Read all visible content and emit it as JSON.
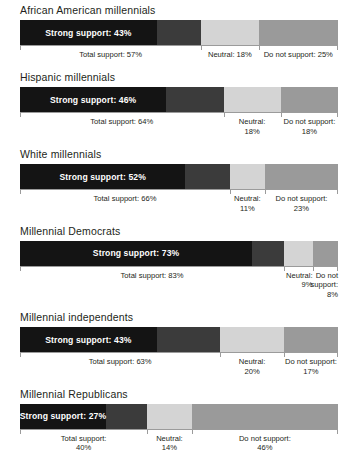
{
  "chart_data": {
    "type": "bar",
    "orientation": "horizontal",
    "stacked": true,
    "title": "",
    "xlabel": "",
    "ylabel": "",
    "xlim": [
      0,
      100
    ],
    "grid": false,
    "legend_position": "none",
    "series": [
      {
        "name": "Strong support",
        "values": [
          43,
          46,
          52,
          73,
          43,
          27
        ]
      },
      {
        "name": "Total support",
        "values": [
          57,
          64,
          66,
          83,
          63,
          40
        ]
      },
      {
        "name": "Neutral",
        "values": [
          18,
          18,
          11,
          9,
          20,
          14
        ]
      },
      {
        "name": "Do not support",
        "values": [
          25,
          18,
          23,
          8,
          17,
          46
        ]
      }
    ],
    "categories": [
      "African American millennials",
      "Hispanic millennials",
      "White millennials",
      "Millennial Democrats",
      "Millennial independents",
      "Millennial Republicans"
    ],
    "colors": {
      "strong_support": "#141414",
      "total_support": "#3b3b3b",
      "neutral": "#d4d4d4",
      "do_not_support": "#9a9a9a",
      "axis": "#9b9b9b",
      "text": "#231f20",
      "bar_label_text": "#ffffff",
      "background": "#ffffff"
    }
  },
  "groups": [
    {
      "title": "African American millennials",
      "strong_label": "Strong support: 43%",
      "strong_pct": 43,
      "total_pct": 57,
      "neutral_pct": 18,
      "oppose_pct": 25,
      "label_total": "Total support: 57%",
      "label_neutral": "Neutral: 18%",
      "label_oppose": "Do not support: 25%",
      "label_style": "single-line"
    },
    {
      "title": "Hispanic millennials",
      "strong_label": "Strong support: 46%",
      "strong_pct": 46,
      "total_pct": 64,
      "neutral_pct": 18,
      "oppose_pct": 18,
      "label_total": "Total support: 64%",
      "label_neutral": "Neutral:\n18%",
      "label_oppose": "Do not support:\n18%",
      "label_style": "two-line"
    },
    {
      "title": "White millennials",
      "strong_label": "Strong support: 52%",
      "strong_pct": 52,
      "total_pct": 66,
      "neutral_pct": 11,
      "oppose_pct": 23,
      "label_total": "Total support: 66%",
      "label_neutral": "Neutral:\n11%",
      "label_oppose": "Do not support:\n23%",
      "label_style": "two-line"
    },
    {
      "title": "Millennial Democrats",
      "strong_label": "Strong support: 73%",
      "strong_pct": 73,
      "total_pct": 83,
      "neutral_pct": 9,
      "oppose_pct": 8,
      "label_total": "Total support: 83%",
      "label_neutral": "Neutral:\n9%",
      "label_oppose": "Do not\nsupport:\n8%",
      "label_style": "narrow"
    },
    {
      "title": "Millennial independents",
      "strong_label": "Strong support: 43%",
      "strong_pct": 43,
      "total_pct": 63,
      "neutral_pct": 20,
      "oppose_pct": 17,
      "label_total": "Total support: 63%",
      "label_neutral": "Neutral:\n20%",
      "label_oppose": "Do not support:\n17%",
      "label_style": "two-line"
    },
    {
      "title": "Millennial Republicans",
      "strong_label": "Strong support: 27%",
      "strong_pct": 27,
      "total_pct": 40,
      "neutral_pct": 14,
      "oppose_pct": 46,
      "label_total": "Total support:\n40%",
      "label_neutral": "Neutral:\n14%",
      "label_oppose": "Do not support:\n46%",
      "label_style": "two-line"
    }
  ]
}
